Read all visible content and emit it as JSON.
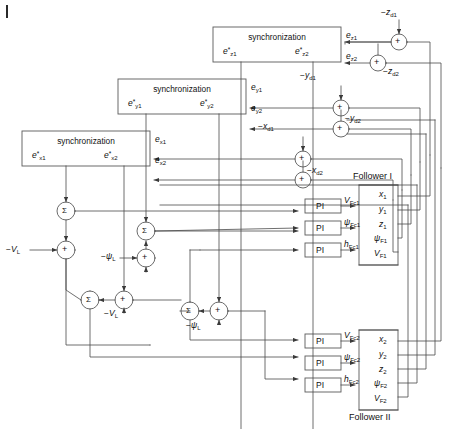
{
  "diagram": {
    "sync_blocks": [
      {
        "id": "sync-x",
        "title": "synchronization",
        "out_left": "e*x1",
        "out_right": "e*x2",
        "in_top": "ex1",
        "in_bottom": "ex2"
      },
      {
        "id": "sync-y",
        "title": "synchronization",
        "out_left": "e*y1",
        "out_right": "e*y2",
        "in_top": "ey1",
        "in_bottom": "ey2"
      },
      {
        "id": "sync-z",
        "title": "synchronization",
        "out_left": "e*z1",
        "out_right": "e*z2",
        "in_top": "ez1",
        "in_bottom": "ez2"
      }
    ],
    "sync_label": "synchronization",
    "error_signals": {
      "ex1": "e",
      "ex2": "e",
      "ey1": "e",
      "ey2": "e",
      "ez1": "e",
      "ez2": "e"
    },
    "disturbances": [
      {
        "name": "-x_d1",
        "base": "−x",
        "sub": "d1"
      },
      {
        "name": "-x_d2",
        "base": "−x",
        "sub": "d2"
      },
      {
        "name": "-y_d1",
        "base": "−y",
        "sub": "d1"
      },
      {
        "name": "-y_d2",
        "base": "−y",
        "sub": "d2"
      },
      {
        "name": "-z_d1",
        "base": "−z",
        "sub": "d1"
      },
      {
        "name": "-z_d2",
        "base": "−z",
        "sub": "d2"
      }
    ],
    "leader_inputs": [
      {
        "name": "-V_L",
        "base": "−V",
        "sub": "L"
      },
      {
        "name": "-psi_L",
        "base": "−ψ",
        "sub": "L"
      }
    ],
    "pi_label": "PI",
    "pi_blocks": [
      {
        "id": "pi-v1",
        "output_base": "V",
        "output_sub": "Fc1"
      },
      {
        "id": "pi-psi1",
        "output_base": "ψ",
        "output_sub": "Fc1"
      },
      {
        "id": "pi-h1",
        "output_base": "h",
        "output_sub": "Fc1"
      },
      {
        "id": "pi-v2",
        "output_base": "V",
        "output_sub": "Fc2"
      },
      {
        "id": "pi-psi2",
        "output_base": "ψ",
        "output_sub": "Fc2"
      },
      {
        "id": "pi-h2",
        "output_base": "h",
        "output_sub": "Fc2"
      }
    ],
    "followers": [
      {
        "id": "follower-1",
        "label": "Follower I",
        "label_position": "above",
        "outputs": [
          {
            "base": "x",
            "sub": "1"
          },
          {
            "base": "y",
            "sub": "1"
          },
          {
            "base": "z",
            "sub": "1"
          },
          {
            "base": "ψ",
            "sub": "F1"
          },
          {
            "base": "V",
            "sub": "F1"
          }
        ]
      },
      {
        "id": "follower-2",
        "label": "Follower II",
        "label_position": "below",
        "outputs": [
          {
            "base": "x",
            "sub": "2"
          },
          {
            "base": "y",
            "sub": "2"
          },
          {
            "base": "z",
            "sub": "2"
          },
          {
            "base": "ψ",
            "sub": "F2"
          },
          {
            "base": "V",
            "sub": "F2"
          }
        ]
      }
    ],
    "sum_symbol": "Σ",
    "add_symbol": "+",
    "colors": {
      "line": "#4a4a4a",
      "box_stroke": "#5a5a5a",
      "text": "#111111",
      "background": "#ffffff"
    }
  }
}
